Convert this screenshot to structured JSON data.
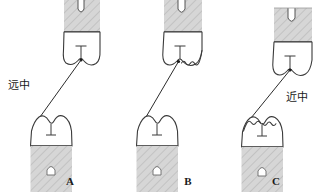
{
  "figure": {
    "title": "",
    "type": "dental-occlusion-diagram",
    "background_color": "#ffffff",
    "outline_color": "#3a3a3a",
    "root_fill_color": "#d4d4d4",
    "hatch_color": "#b8b8b8",
    "line_color": "#2b2b2b"
  },
  "labels": {
    "distal": "远中",
    "mesial": "近中"
  },
  "panels": [
    {
      "id": "panel-a",
      "letter": "A",
      "upper_tooth": "upper-molar-a",
      "lower_tooth": "lower-molar-a",
      "contact_line": "contact-line-a",
      "worn_edges": "none"
    },
    {
      "id": "panel-b",
      "letter": "B",
      "upper_tooth": "upper-molar-b",
      "lower_tooth": "lower-molar-b",
      "contact_line": "contact-line-b",
      "worn_edges": "distal"
    },
    {
      "id": "panel-c",
      "letter": "C",
      "upper_tooth": "upper-molar-c",
      "lower_tooth": "lower-molar-c",
      "contact_line": "contact-line-c",
      "worn_edges": "mesial"
    }
  ]
}
